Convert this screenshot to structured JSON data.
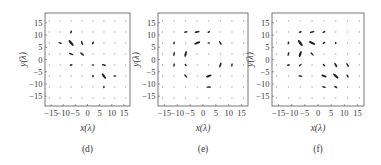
{
  "chart_data": [
    {
      "type": "scatter",
      "subtype": "vector-field (polarization ellipse map)",
      "caption": "(d)",
      "xlabel": "x(λ)",
      "ylabel": "y(λ)",
      "xlim": [
        -17.5,
        17.5
      ],
      "ylim": [
        -19,
        19
      ],
      "xticks": [
        "-15",
        "-10",
        "-5",
        "0",
        "5",
        "10",
        "15"
      ],
      "yticks": [
        "15",
        "10",
        "5",
        "0",
        "-5",
        "-10",
        "-15"
      ],
      "grid": false,
      "vectors": [
        {
          "x": -6.75,
          "y": 11.25,
          "len": 1.6,
          "angle": 70
        },
        {
          "x": -11.25,
          "y": 6.75,
          "len": 1.8,
          "angle": -20
        },
        {
          "x": -6.75,
          "y": 6.75,
          "len": 3.6,
          "angle": -50
        },
        {
          "x": -2.25,
          "y": 6.75,
          "len": 2.4,
          "angle": -70
        },
        {
          "x": 2.25,
          "y": 6.75,
          "len": 1.6,
          "angle": 60
        },
        {
          "x": -6.75,
          "y": 2.25,
          "len": 2.6,
          "angle": -20
        },
        {
          "x": -2.25,
          "y": 2.25,
          "len": 2.4,
          "angle": -40
        },
        {
          "x": -6.75,
          "y": -2.25,
          "len": 1.6,
          "angle": 20
        },
        {
          "x": 2.25,
          "y": -2.25,
          "len": 1.4,
          "angle": 0
        },
        {
          "x": 6.75,
          "y": -2.25,
          "len": 2.2,
          "angle": -10
        },
        {
          "x": 2.25,
          "y": -6.75,
          "len": 1.4,
          "angle": 80
        },
        {
          "x": 6.75,
          "y": -6.75,
          "len": 3.2,
          "angle": -55
        },
        {
          "x": 11.25,
          "y": -6.75,
          "len": 1.6,
          "angle": 0
        },
        {
          "x": 6.75,
          "y": -11.25,
          "len": 1.2,
          "angle": 80
        }
      ]
    },
    {
      "type": "scatter",
      "subtype": "vector-field (polarization ellipse map)",
      "caption": "(e)",
      "xlabel": "x(λ)",
      "ylabel": "y(λ)",
      "xlim": [
        -17.5,
        17.5
      ],
      "ylim": [
        -19,
        19
      ],
      "xticks": [
        "-15",
        "-10",
        "-5",
        "0",
        "5",
        "10",
        "15"
      ],
      "yticks": [
        "15",
        "10",
        "5",
        "0",
        "-5",
        "-10",
        "-15"
      ],
      "grid": false,
      "vectors": [
        {
          "x": -6.75,
          "y": 11.25,
          "len": 1.8,
          "angle": 10
        },
        {
          "x": -2.25,
          "y": 11.25,
          "len": 2.6,
          "angle": 10
        },
        {
          "x": 2.25,
          "y": 11.25,
          "len": 1.4,
          "angle": 20
        },
        {
          "x": -11.25,
          "y": 6.75,
          "len": 1.6,
          "angle": 80
        },
        {
          "x": -2.25,
          "y": 6.75,
          "len": 3.2,
          "angle": 20
        },
        {
          "x": 2.25,
          "y": 6.75,
          "len": 1.4,
          "angle": 0
        },
        {
          "x": 6.75,
          "y": 6.75,
          "len": 2.2,
          "angle": -60
        },
        {
          "x": -11.25,
          "y": 2.25,
          "len": 2.2,
          "angle": 85
        },
        {
          "x": -6.75,
          "y": 2.25,
          "len": 3.0,
          "angle": 75
        },
        {
          "x": -11.25,
          "y": -2.25,
          "len": 1.8,
          "angle": 80
        },
        {
          "x": -6.75,
          "y": -2.25,
          "len": 1.4,
          "angle": -60
        },
        {
          "x": 6.75,
          "y": -2.25,
          "len": 2.6,
          "angle": 70
        },
        {
          "x": 11.25,
          "y": -2.25,
          "len": 1.8,
          "angle": 80
        },
        {
          "x": -6.75,
          "y": -6.75,
          "len": 2.0,
          "angle": -50
        },
        {
          "x": 2.25,
          "y": -6.75,
          "len": 3.0,
          "angle": 20
        },
        {
          "x": 2.25,
          "y": -11.25,
          "len": 2.4,
          "angle": 0
        }
      ]
    },
    {
      "type": "scatter",
      "subtype": "vector-field (polarization ellipse map)",
      "caption": "(f)",
      "xlabel": "x(λ)",
      "ylabel": "y(λ)",
      "xlim": [
        -17.5,
        17.5
      ],
      "ylim": [
        -19,
        19
      ],
      "xticks": [
        "-15",
        "-10",
        "-5",
        "0",
        "5",
        "10",
        "15"
      ],
      "yticks": [
        "15",
        "10",
        "5",
        "0",
        "-5",
        "-10",
        "-15"
      ],
      "grid": false,
      "vectors": [
        {
          "x": -6.75,
          "y": 11.25,
          "len": 1.6,
          "angle": 20
        },
        {
          "x": -2.25,
          "y": 11.25,
          "len": 2.4,
          "angle": 10
        },
        {
          "x": 2.25,
          "y": 11.25,
          "len": 1.6,
          "angle": 30
        },
        {
          "x": -11.25,
          "y": 6.75,
          "len": 1.6,
          "angle": 70
        },
        {
          "x": -6.75,
          "y": 6.75,
          "len": 3.6,
          "angle": -55
        },
        {
          "x": -2.25,
          "y": 6.75,
          "len": 3.4,
          "angle": -25
        },
        {
          "x": 2.25,
          "y": 6.75,
          "len": 1.6,
          "angle": 40
        },
        {
          "x": 6.75,
          "y": 6.75,
          "len": 1.2,
          "angle": 80
        },
        {
          "x": -11.25,
          "y": 2.25,
          "len": 2.0,
          "angle": 75
        },
        {
          "x": -6.75,
          "y": 2.25,
          "len": 3.2,
          "angle": 70
        },
        {
          "x": -2.25,
          "y": 2.25,
          "len": 2.2,
          "angle": -45
        },
        {
          "x": -11.25,
          "y": -2.25,
          "len": 1.6,
          "angle": 20
        },
        {
          "x": -6.75,
          "y": -2.25,
          "len": 1.8,
          "angle": 40
        },
        {
          "x": 2.25,
          "y": -2.25,
          "len": 1.6,
          "angle": -50
        },
        {
          "x": 6.75,
          "y": -2.25,
          "len": 2.6,
          "angle": -60
        },
        {
          "x": 11.25,
          "y": -2.25,
          "len": 2.2,
          "angle": -60
        },
        {
          "x": -6.75,
          "y": -6.75,
          "len": 2.0,
          "angle": -10
        },
        {
          "x": 2.25,
          "y": -6.75,
          "len": 2.8,
          "angle": -20
        },
        {
          "x": 6.75,
          "y": -6.75,
          "len": 3.4,
          "angle": -45
        },
        {
          "x": 11.25,
          "y": -6.75,
          "len": 1.8,
          "angle": -60
        },
        {
          "x": 2.25,
          "y": -11.25,
          "len": 2.0,
          "angle": -20
        },
        {
          "x": 6.75,
          "y": -11.25,
          "len": 1.8,
          "angle": -30
        }
      ]
    }
  ],
  "grid_points": [
    -15.75,
    -11.25,
    -6.75,
    -2.25,
    2.25,
    6.75,
    11.25,
    15.75
  ],
  "tick_values": [
    -15,
    -10,
    -5,
    0,
    5,
    10,
    15
  ],
  "panels": [
    {
      "caption": "(d)",
      "xlabel": "x(λ)",
      "ylabel": "y(λ)"
    },
    {
      "caption": "(e)",
      "xlabel": "x(λ)",
      "ylabel": "y(λ)"
    },
    {
      "caption": "(f)",
      "xlabel": "x(λ)",
      "ylabel": "y(λ)"
    }
  ],
  "colors": {
    "frame": "#555555",
    "vector": "#222222",
    "dot": "#8a8a8a",
    "text": "#3a3a3a"
  }
}
